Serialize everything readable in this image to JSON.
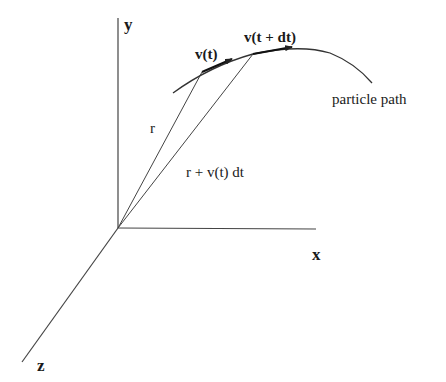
{
  "diagram": {
    "type": "3d-coordinate-vector-diagram",
    "axes": {
      "x_label": "x",
      "y_label": "y",
      "z_label": "z"
    },
    "vectors": {
      "position_label": "r",
      "displaced_position_label": "r + v(t) dt",
      "velocity_t_label": "v(t)",
      "velocity_t_dt_label": "v(t + dt)"
    },
    "curve_label": "particle path",
    "colors": {
      "line": "#333333",
      "text": "#1a1a1a",
      "background": "#ffffff"
    }
  }
}
